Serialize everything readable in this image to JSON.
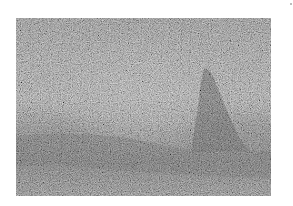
{
  "image": {
    "description": "Heavily noise-degraded grayscale photograph of a landscape with a conical tree on the right",
    "colors": {
      "base_gray": "#7a7a7a",
      "sky_light": "#8c8c8c",
      "horizon_dark": "#5a5a5a",
      "tree_dark": "#4e4e4e",
      "background": "#ffffff"
    },
    "regions": [
      {
        "name": "sky",
        "tone": "medium-light gray"
      },
      {
        "name": "tree",
        "tone": "dark gray",
        "position": "right-center"
      },
      {
        "name": "horizon-band",
        "tone": "dark gray",
        "position": "lower third"
      },
      {
        "name": "foreground",
        "tone": "medium gray"
      }
    ]
  }
}
